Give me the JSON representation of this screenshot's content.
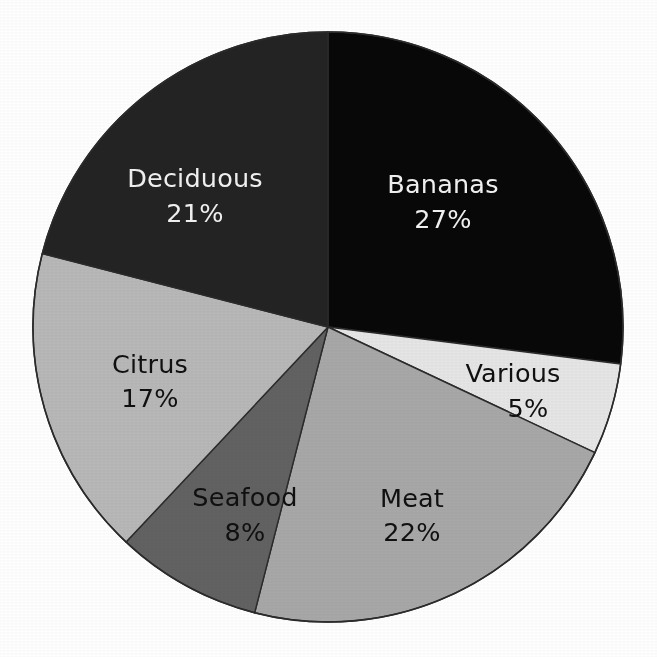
{
  "chart_data": {
    "type": "pie",
    "title": "",
    "subtitle": "",
    "xlabel": "",
    "ylabel": "",
    "legend_position": "none",
    "grid": false,
    "labels_inside": true,
    "start_angle_deg": 0,
    "direction": "clockwise",
    "categories": [
      "Bananas",
      "Various",
      "Meat",
      "Seafood",
      "Citrus",
      "Deciduous"
    ],
    "values": [
      27,
      5,
      22,
      8,
      17,
      21
    ],
    "value_suffix": "%",
    "slices": [
      {
        "label": "Bananas",
        "value": 27,
        "value_text": "27%",
        "color": "#080808",
        "text_color": "#f2f2f2",
        "start_deg": 0,
        "end_deg": 97.2,
        "label_x": 443,
        "label_y": 186,
        "value_x": 443,
        "value_y": 221
      },
      {
        "label": "Various",
        "value": 5,
        "value_text": "5%",
        "color": "#e6e6e6",
        "text_color": "#101010",
        "start_deg": 97.2,
        "end_deg": 115.2,
        "label_x": 513,
        "label_y": 375,
        "value_x": 528,
        "value_y": 410
      },
      {
        "label": "Meat",
        "value": 22,
        "value_text": "22%",
        "color": "#a8a8a8",
        "text_color": "#101010",
        "start_deg": 115.2,
        "end_deg": 194.4,
        "label_x": 412,
        "label_y": 500,
        "value_x": 412,
        "value_y": 534
      },
      {
        "label": "Seafood",
        "value": 8,
        "value_text": "8%",
        "color": "#626262",
        "text_color": "#101010",
        "start_deg": 194.4,
        "end_deg": 223.2,
        "label_x": 245,
        "label_y": 499,
        "value_x": 245,
        "value_y": 534
      },
      {
        "label": "Citrus",
        "value": 17,
        "value_text": "17%",
        "color": "#b8b8b8",
        "text_color": "#101010",
        "start_deg": 223.2,
        "end_deg": 284.4,
        "label_x": 150,
        "label_y": 366,
        "value_x": 150,
        "value_y": 400
      },
      {
        "label": "Deciduous",
        "value": 21,
        "value_text": "21%",
        "color": "#232323",
        "text_color": "#f2f2f2",
        "start_deg": 284.4,
        "end_deg": 360,
        "label_x": 195,
        "label_y": 180,
        "value_x": 195,
        "value_y": 215
      }
    ],
    "geometry": {
      "center_x": 328,
      "center_y": 327,
      "radius": 295,
      "outline_color": "#2b2b2b",
      "outline_width": 1.6,
      "background": "#ffffff"
    }
  }
}
